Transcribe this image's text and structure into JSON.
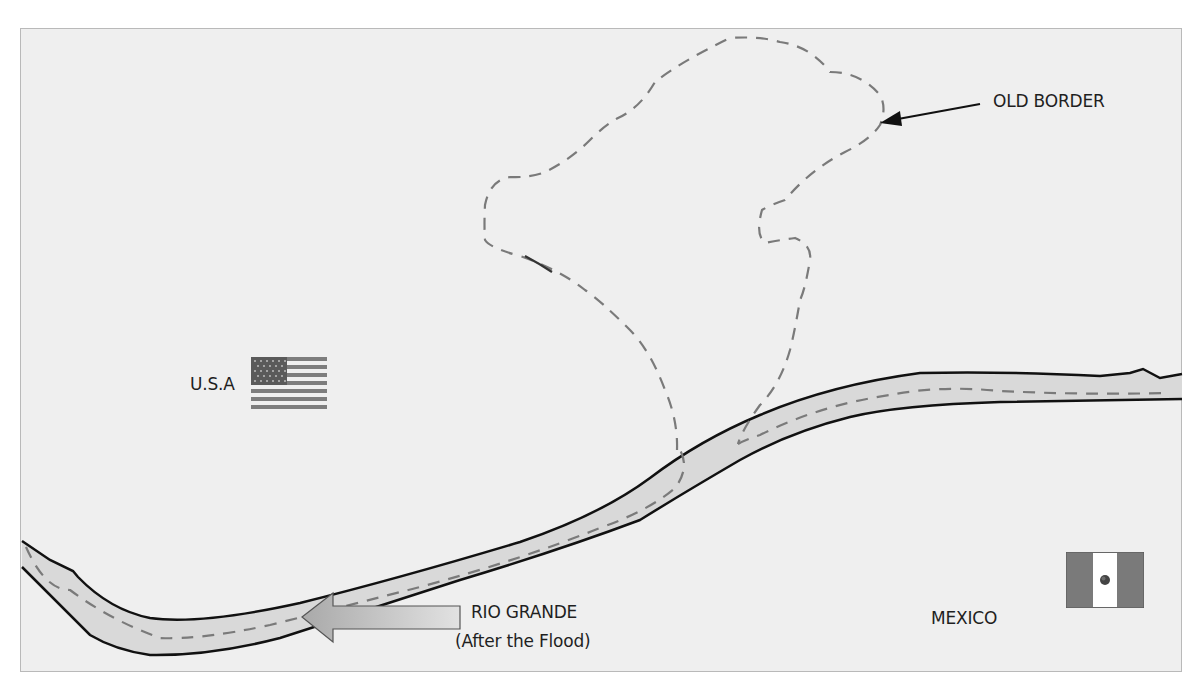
{
  "map": {
    "title": "Rio Grande border shift",
    "colors": {
      "background": "#efefef",
      "river_fill": "#d9d9d9",
      "river_edge": "#111111",
      "dashed_line": "#7a7a7a",
      "arrow_fill": "#b8b8b8",
      "text": "#1f1f1f"
    },
    "labels": {
      "old_border": "OLD BORDER",
      "usa": "U.S.A",
      "river_name": "RIO GRANDE",
      "river_note": "(After the Flood)",
      "mexico": "MEXICO"
    },
    "icons": {
      "usa_flag": "us-flag-icon",
      "mexico_flag": "mexico-flag-icon",
      "old_border_arrow": "arrow-left-icon",
      "river_arrow": "block-arrow-left-icon"
    }
  }
}
